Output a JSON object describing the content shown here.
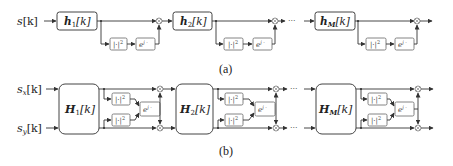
{
  "panel_a": {
    "caption": "(a)",
    "input_label": "s[k]",
    "input_symbol": "s",
    "input_index": "[k]",
    "filters": [
      {
        "symbol": "h",
        "sub": "1",
        "arg": "[k]"
      },
      {
        "symbol": "h",
        "sub": "2",
        "arg": "[k]"
      },
      {
        "symbol": "h",
        "sub": "M",
        "arg": "[k]"
      }
    ],
    "power_block": "|·|²",
    "power_block_base": "|·|",
    "power_block_exp": "2",
    "phase_block": "e^{j·}",
    "phase_block_base": "e",
    "phase_block_exp": "j ·",
    "multiplier": "⊗",
    "ellipsis": "···"
  },
  "panel_b": {
    "caption": "(b)",
    "inputs": [
      {
        "symbol": "s",
        "sub": "x",
        "arg": "[k]"
      },
      {
        "symbol": "s",
        "sub": "y",
        "arg": "[k]"
      }
    ],
    "filters": [
      {
        "symbol": "H",
        "sub": "1",
        "arg": "[k]"
      },
      {
        "symbol": "H",
        "sub": "2",
        "arg": "[k]"
      },
      {
        "symbol": "H",
        "sub": "M",
        "arg": "[k]"
      }
    ],
    "power_block_base": "|·|",
    "power_block_exp": "2",
    "phase_block_base": "e",
    "phase_block_exp": "j ·",
    "multiplier": "⊗",
    "ellipsis": "···"
  }
}
